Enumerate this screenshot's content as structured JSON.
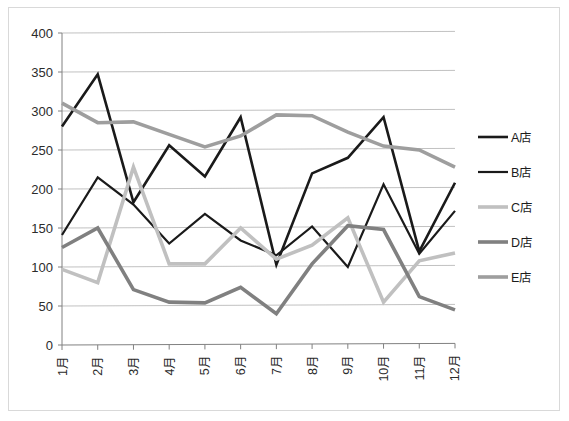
{
  "chart_data": {
    "type": "line",
    "title": "",
    "subtitle": "",
    "xlabel": "",
    "ylabel": "",
    "ylim": [
      0,
      400
    ],
    "y_ticks": [
      0,
      50,
      100,
      150,
      200,
      250,
      300,
      350,
      400
    ],
    "grid": true,
    "legend_position": "right",
    "categories": [
      "1月",
      "2月",
      "3月",
      "4月",
      "5月",
      "6月",
      "7月",
      "8月",
      "9月",
      "10月",
      "11月",
      "12月"
    ],
    "series": [
      {
        "name": "A店",
        "color": "#1a1a1a",
        "width": 2.6,
        "values": [
          280,
          347,
          183,
          256,
          216,
          292,
          103,
          220,
          240,
          292,
          120,
          208
        ]
      },
      {
        "name": "B店",
        "color": "#1a1a1a",
        "width": 2.2,
        "values": [
          141,
          215,
          180,
          130,
          168,
          134,
          115,
          152,
          100,
          206,
          117,
          172
        ]
      },
      {
        "name": "C店",
        "color": "#c0c0c0",
        "width": 3.6,
        "values": [
          97,
          80,
          228,
          104,
          104,
          150,
          110,
          128,
          163,
          55,
          108,
          118
        ]
      },
      {
        "name": "D店",
        "color": "#808080",
        "width": 3.6,
        "values": [
          125,
          150,
          71,
          55,
          54,
          74,
          40,
          104,
          153,
          148,
          62,
          45
        ]
      },
      {
        "name": "E店",
        "color": "#9e9e9e",
        "width": 3.6,
        "values": [
          310,
          285,
          286,
          270,
          254,
          268,
          295,
          294,
          273,
          255,
          250,
          228
        ]
      }
    ]
  },
  "legend": {
    "items": [
      {
        "label": "A店"
      },
      {
        "label": "B店"
      },
      {
        "label": "C店"
      },
      {
        "label": "D店"
      },
      {
        "label": "E店"
      }
    ]
  }
}
